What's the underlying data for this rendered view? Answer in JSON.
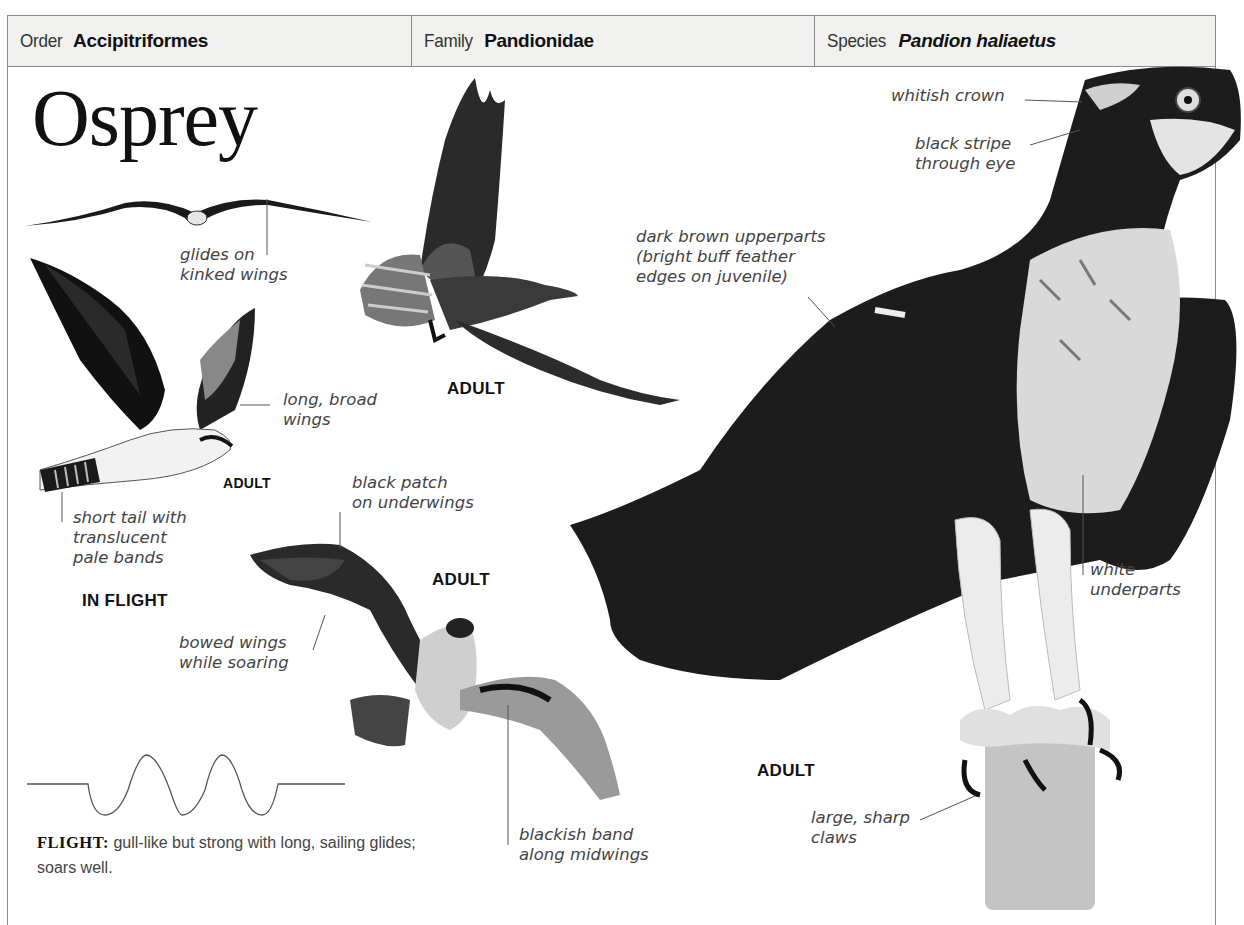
{
  "header": {
    "order": {
      "label": "Order",
      "value": "Accipitriformes"
    },
    "family": {
      "label": "Family",
      "value": "Pandionidae"
    },
    "species": {
      "label": "Species",
      "value": "Pandion haliaetus"
    }
  },
  "title": "Osprey",
  "annotations": {
    "glides": "glides on\nkinked wings",
    "long_broad": "long, broad\nwings",
    "short_tail": "short tail with\ntranslucent\npale bands",
    "black_patch": "black patch\non underwings",
    "bowed_wings": "bowed wings\nwhile soaring",
    "blackish_band": "blackish band\nalong midwings",
    "dark_brown": "dark brown upperparts\n(bright buff feather\nedges on juvenile)",
    "whitish_crown": "whitish crown",
    "black_stripe": "black stripe\nthrough eye",
    "white_underparts": "white\nunderparts",
    "claws": "large, sharp\nclaws"
  },
  "tags": {
    "adult_flight_small": "ADULT",
    "adult_top": "ADULT",
    "adult_soaring": "ADULT",
    "adult_perched": "ADULT",
    "in_flight": "IN FLIGHT"
  },
  "flight": {
    "label": "FLIGHT:",
    "text": " gull-like but strong with long, sailing glides; soars well."
  },
  "colors": {
    "border": "#8a8a8a",
    "header_bg": "#f1f1ef",
    "bird_dark": "#1a1a1a",
    "bird_mid": "#555555",
    "bird_light": "#d8d8d8"
  }
}
